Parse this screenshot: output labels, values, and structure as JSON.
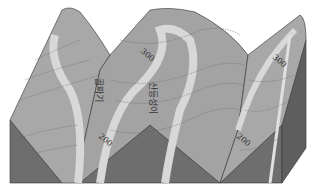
{
  "diagram": {
    "title": "",
    "type": "topographic block diagram",
    "labels": {
      "valley": "골짜기",
      "ridge": "산등성이"
    },
    "contour_labels": [
      {
        "value": "300",
        "position": "center-top"
      },
      {
        "value": "300",
        "position": "right-top"
      },
      {
        "value": "200",
        "position": "left-bottom"
      },
      {
        "value": "200",
        "position": "right-bottom"
      }
    ],
    "colors": {
      "surface": "#a8a8a8",
      "surface_dark": "#9a9a9a",
      "side_face": "#6e6e6e",
      "highlight_band": "#d8d8d8",
      "contour_line": "#666666",
      "edge": "#333333"
    }
  }
}
